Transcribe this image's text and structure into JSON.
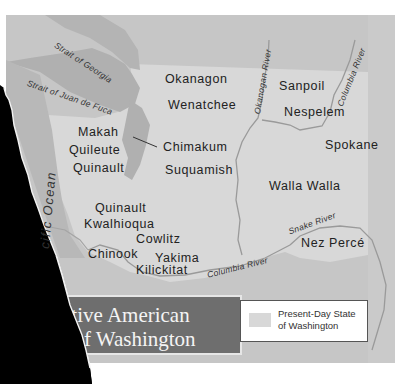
{
  "map": {
    "title_lines": [
      "Native American",
      "Tribes of Washington"
    ],
    "visible_title_lines": [
      "ative American",
      "s of Washington"
    ],
    "colors": {
      "background_land": "#c6c6c6",
      "washington_state": "#d8d8d8",
      "water": "#a8a8a8",
      "rivers": "#9a9a9a",
      "title_box": "#6e6e6e",
      "title_text": "#f4f4f4",
      "torn_edge": "#000000"
    },
    "water_labels": {
      "strait_georgia": "Strait of Georgia",
      "strait_juan_de_fuca": "Strait of Juan de Fuca",
      "okanogan_river": "Okanogan River",
      "columbia_river_north": "Columbia River",
      "snake_river": "Snake River",
      "columbia_river_south": "Columbia River",
      "pacific_ocean": "cific Ocean"
    },
    "tribes": {
      "okanagon": "Okanagon",
      "wenatchee": "Wenatchee",
      "sanpoil": "Sanpoil",
      "nespelem": "Nespelem",
      "spokane": "Spokane",
      "makah": "Makah",
      "quileute": "Quileute",
      "quinault_north": "Quinault",
      "chimakum": "Chimakum",
      "suquamish": "Suquamish",
      "walla_walla": "Walla Walla",
      "quinault_south": "Quinault",
      "kwalhioqua": "Kwalhioqua",
      "cowlitz": "Cowlitz",
      "chinook": "Chinook",
      "yakima": "Yakima",
      "kilickitat": "Kilickitat",
      "nez_perce": "Nez Percé"
    },
    "legend": {
      "line1": "Present-Day State",
      "line2": "of Washington"
    }
  }
}
